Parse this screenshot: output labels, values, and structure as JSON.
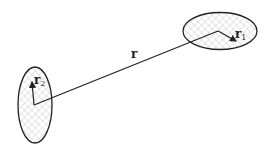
{
  "diagram": {
    "type": "two-body position vectors",
    "labels": {
      "r": "r",
      "r1": "r",
      "r1_sub": "1",
      "r2": "r",
      "r2_sub": "2"
    },
    "bodies": [
      {
        "name": "body-1",
        "center": [
          220,
          31
        ],
        "rx": 37,
        "ry": 19,
        "fill": "crosshatch"
      },
      {
        "name": "body-2",
        "center": [
          35,
          105
        ],
        "rx": 17,
        "ry": 38,
        "fill": "crosshatch"
      }
    ],
    "colors": {
      "stroke": "#222222",
      "hatch": "#bbbbbb"
    }
  }
}
